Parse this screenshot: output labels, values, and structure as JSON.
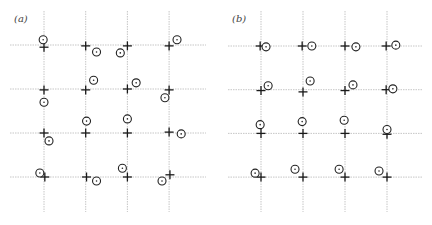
{
  "panels": [
    {
      "id": "a",
      "label": "(a)",
      "grid": {
        "cols": 4,
        "rows": 4
      },
      "legend": {
        "cross": "lattice site",
        "circle": "displaced particle"
      },
      "points": [
        {
          "row": 0,
          "col": 0,
          "cross": [
            0,
            0.05
          ],
          "circle": [
            -0.02,
            -0.12
          ]
        },
        {
          "row": 0,
          "col": 1,
          "cross": [
            0,
            0.02
          ],
          "circle": [
            0.26,
            0.16
          ]
        },
        {
          "row": 0,
          "col": 2,
          "cross": [
            0,
            0.02
          ],
          "circle": [
            -0.17,
            0.18
          ]
        },
        {
          "row": 0,
          "col": 3,
          "cross": [
            0,
            0.02
          ],
          "circle": [
            0.19,
            -0.12
          ]
        },
        {
          "row": 1,
          "col": 0,
          "cross": [
            0,
            0.02
          ],
          "circle": [
            0,
            0.3
          ]
        },
        {
          "row": 1,
          "col": 1,
          "cross": [
            0,
            0.02
          ],
          "circle": [
            0.19,
            -0.2
          ]
        },
        {
          "row": 1,
          "col": 2,
          "cross": [
            0,
            0
          ],
          "circle": [
            0.21,
            -0.14
          ]
        },
        {
          "row": 1,
          "col": 3,
          "cross": [
            0,
            0.02
          ],
          "circle": [
            -0.1,
            0.2
          ]
        },
        {
          "row": 2,
          "col": 0,
          "cross": [
            0,
            0
          ],
          "circle": [
            0.12,
            0.18
          ]
        },
        {
          "row": 2,
          "col": 1,
          "cross": [
            0,
            0
          ],
          "circle": [
            0.02,
            -0.27
          ]
        },
        {
          "row": 2,
          "col": 2,
          "cross": [
            0,
            0
          ],
          "circle": [
            0,
            -0.32
          ]
        },
        {
          "row": 2,
          "col": 3,
          "cross": [
            0,
            -0.02
          ],
          "circle": [
            0.29,
            0.02
          ]
        },
        {
          "row": 3,
          "col": 0,
          "cross": [
            0.02,
            0
          ],
          "circle": [
            -0.1,
            -0.09
          ]
        },
        {
          "row": 3,
          "col": 1,
          "cross": [
            0.02,
            0
          ],
          "circle": [
            0.26,
            0.09
          ]
        },
        {
          "row": 3,
          "col": 2,
          "cross": [
            0,
            0
          ],
          "circle": [
            -0.12,
            -0.2
          ]
        },
        {
          "row": 3,
          "col": 3,
          "cross": [
            0.02,
            -0.05
          ],
          "circle": [
            -0.17,
            0.09
          ]
        }
      ]
    },
    {
      "id": "b",
      "label": "(b)",
      "grid": {
        "cols": 4,
        "rows": 4
      },
      "legend": {
        "cross": "lattice site",
        "circle": "displaced particle"
      },
      "points": [
        {
          "row": 0,
          "col": 0,
          "cross": [
            -0.02,
            0
          ],
          "circle": [
            0.12,
            0.02
          ]
        },
        {
          "row": 0,
          "col": 1,
          "cross": [
            -0.02,
            0
          ],
          "circle": [
            0.21,
            0
          ]
        },
        {
          "row": 0,
          "col": 2,
          "cross": [
            0,
            0
          ],
          "circle": [
            0.26,
            0.02
          ]
        },
        {
          "row": 0,
          "col": 3,
          "cross": [
            -0.02,
            0
          ],
          "circle": [
            0.21,
            -0.02
          ]
        },
        {
          "row": 1,
          "col": 0,
          "cross": [
            0,
            0.02
          ],
          "circle": [
            0.17,
            -0.09
          ]
        },
        {
          "row": 1,
          "col": 1,
          "cross": [
            0,
            0.05
          ],
          "circle": [
            0.17,
            -0.2
          ]
        },
        {
          "row": 1,
          "col": 2,
          "cross": [
            0,
            0.02
          ],
          "circle": [
            0.19,
            -0.11
          ]
        },
        {
          "row": 1,
          "col": 3,
          "cross": [
            -0.02,
            0
          ],
          "circle": [
            0.14,
            -0.02
          ]
        },
        {
          "row": 2,
          "col": 0,
          "cross": [
            0,
            0
          ],
          "circle": [
            -0.02,
            -0.2
          ]
        },
        {
          "row": 2,
          "col": 1,
          "cross": [
            0,
            0
          ],
          "circle": [
            -0.02,
            -0.27
          ]
        },
        {
          "row": 2,
          "col": 2,
          "cross": [
            0,
            0
          ],
          "circle": [
            -0.02,
            -0.3
          ]
        },
        {
          "row": 2,
          "col": 3,
          "cross": [
            0,
            0.02
          ],
          "circle": [
            0,
            -0.09
          ]
        },
        {
          "row": 3,
          "col": 0,
          "cross": [
            0,
            0
          ],
          "circle": [
            -0.14,
            -0.09
          ]
        },
        {
          "row": 3,
          "col": 1,
          "cross": [
            0,
            0
          ],
          "circle": [
            -0.19,
            -0.18
          ]
        },
        {
          "row": 3,
          "col": 2,
          "cross": [
            0,
            0
          ],
          "circle": [
            -0.14,
            -0.18
          ]
        },
        {
          "row": 3,
          "col": 3,
          "cross": [
            0,
            0
          ],
          "circle": [
            -0.19,
            -0.14
          ]
        }
      ]
    }
  ]
}
